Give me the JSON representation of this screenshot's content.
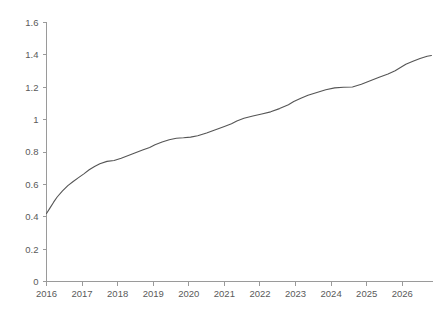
{
  "chart_data": {
    "type": "line",
    "title": "",
    "subtitle": "",
    "xlabel": "",
    "ylabel": "",
    "xlim": [
      2016,
      2026.85
    ],
    "ylim": [
      0,
      1.6
    ],
    "grid": false,
    "legend": null,
    "legend_position": "none",
    "line_color": "#555555",
    "axis_color": "#9a9a9a",
    "tick_label_color": "#5a5a5a",
    "background_color": "#ffffff",
    "y_ticks": [
      0,
      0.2,
      0.4,
      0.6,
      0.8,
      1,
      1.2,
      1.4,
      1.6
    ],
    "y_tick_labels": [
      "0",
      "0.2",
      "0.4",
      "0.6",
      "0.8",
      "1",
      "1.2",
      "1.4",
      "1.6"
    ],
    "x_ticks": [
      2016,
      2017,
      2018,
      2019,
      2020,
      2021,
      2022,
      2023,
      2024,
      2025,
      2026
    ],
    "x_tick_labels": [
      "2016",
      "2017",
      "2018",
      "2019",
      "2020",
      "2021",
      "2022",
      "2023",
      "2024",
      "2025",
      "2026"
    ],
    "series": [
      {
        "name": "series-1",
        "color": "#555555",
        "x": [
          2016.0,
          2016.1,
          2016.2,
          2016.3,
          2016.45,
          2016.6,
          2016.75,
          2016.9,
          2017.05,
          2017.2,
          2017.35,
          2017.5,
          2017.7,
          2017.9,
          2018.1,
          2018.3,
          2018.5,
          2018.7,
          2018.9,
          2019.05,
          2019.25,
          2019.45,
          2019.65,
          2019.85,
          2020.05,
          2020.25,
          2020.5,
          2020.75,
          2021.0,
          2021.2,
          2021.35,
          2021.55,
          2021.8,
          2022.05,
          2022.3,
          2022.55,
          2022.8,
          2022.95,
          2023.15,
          2023.35,
          2023.6,
          2023.85,
          2024.1,
          2024.35,
          2024.6,
          2024.85,
          2025.1,
          2025.35,
          2025.6,
          2025.8,
          2025.95,
          2026.1,
          2026.3,
          2026.5,
          2026.7,
          2026.82
        ],
        "y": [
          0.42,
          0.455,
          0.49,
          0.522,
          0.56,
          0.592,
          0.618,
          0.642,
          0.665,
          0.69,
          0.71,
          0.728,
          0.742,
          0.748,
          0.762,
          0.778,
          0.795,
          0.812,
          0.828,
          0.845,
          0.862,
          0.876,
          0.885,
          0.888,
          0.892,
          0.9,
          0.918,
          0.938,
          0.958,
          0.975,
          0.992,
          1.008,
          1.022,
          1.035,
          1.048,
          1.068,
          1.092,
          1.112,
          1.132,
          1.15,
          1.168,
          1.185,
          1.196,
          1.2,
          1.202,
          1.218,
          1.24,
          1.262,
          1.282,
          1.302,
          1.322,
          1.342,
          1.36,
          1.378,
          1.392,
          1.396
        ]
      }
    ],
    "annotations": []
  }
}
